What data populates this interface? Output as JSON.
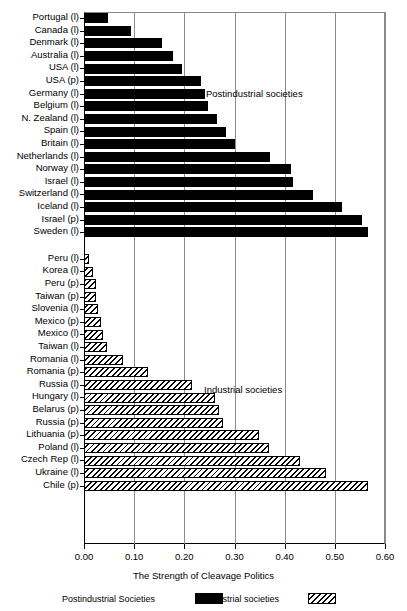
{
  "chart_data": {
    "type": "bar",
    "orientation": "horizontal",
    "title": "",
    "xlabel": "The Strength of Cleavage Politics",
    "ylabel": "",
    "xlim": [
      0.0,
      0.6
    ],
    "xticks": [
      "0.00",
      "0.10",
      "0.20",
      "0.30",
      "0.40",
      "0.50",
      "0.60"
    ],
    "xtick_values": [
      0.0,
      0.1,
      0.2,
      0.3,
      0.4,
      0.5,
      0.6
    ],
    "grid": true,
    "grid_axis": "x",
    "legend_position": "bottom",
    "annotations": [
      {
        "text": "Postindustrial societies",
        "group": "postindustrial"
      },
      {
        "text": "Industrial societies",
        "group": "industrial"
      }
    ],
    "series": [
      {
        "name": "Postindustrial Societies",
        "style": "solid-black",
        "color": "#000000",
        "categories": [
          "Portugal (l)",
          "Canada (l)",
          "Denmark (l)",
          "Australia (l)",
          "USA (l)",
          "USA (p)",
          "Germany (l)",
          "Belgium (l)",
          "N. Zealand (l)",
          "Spain (l)",
          "Britain (l)",
          "Netherlands (l)",
          "Norway (l)",
          "Israel (l)",
          "Switzerland (l)",
          "Iceland (l)",
          "Israel (p)",
          "Sweden (l)"
        ],
        "values": [
          0.047,
          0.094,
          0.155,
          0.177,
          0.195,
          0.234,
          0.241,
          0.247,
          0.265,
          0.283,
          0.301,
          0.371,
          0.412,
          0.416,
          0.457,
          0.515,
          0.555,
          0.567
        ]
      },
      {
        "name": "Industrial societies",
        "style": "hatched",
        "color": "#000000",
        "categories": [
          "Peru (l)",
          "Korea (l)",
          "Peru (p)",
          "Taiwan (p)",
          "Slovenia (l)",
          "Mexico (p)",
          "Mexico (l)",
          "Taiwan (l)",
          "Romania (l)",
          "Romania (p)",
          "Russia (l)",
          "Hungary (l)",
          "Belarus (p)",
          "Russia (p)",
          "Lithuania (p)",
          "Poland (l)",
          "Czech Rep (l)",
          "Ukraine (l)",
          "Chile (p)"
        ],
        "values": [
          0.009,
          0.017,
          0.023,
          0.023,
          0.027,
          0.033,
          0.037,
          0.046,
          0.078,
          0.127,
          0.216,
          0.261,
          0.27,
          0.277,
          0.348,
          0.368,
          0.431,
          0.483,
          0.567
        ]
      }
    ]
  },
  "legend": {
    "postindustrial_label": "Postindustrial Societies",
    "industrial_label": "Industrial societies"
  },
  "axis": {
    "title": "The Strength of Cleavage Politics"
  }
}
